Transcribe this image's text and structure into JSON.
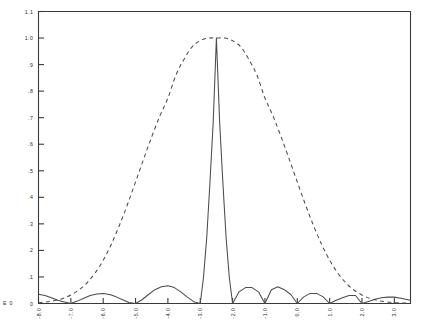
{
  "chart_data": {
    "type": "line",
    "title": "",
    "subtitle": "",
    "xlabel": "",
    "ylabel": "",
    "xlim": [
      -8.0,
      3.5
    ],
    "ylim": [
      0.0,
      1.1
    ],
    "grid": false,
    "legend": "none",
    "exponent_annotation": "E 0",
    "x_ticks": [
      "-8.0",
      "-7.0",
      "-6.0",
      "-5.0",
      "-4.0",
      "-3.0",
      "-2.0",
      "-1.0",
      "0.0",
      "1.0",
      "2.0",
      "3.0"
    ],
    "x_tick_values": [
      -8.0,
      -7.0,
      -6.0,
      -5.0,
      -4.0,
      -3.0,
      -2.0,
      -1.0,
      0.0,
      1.0,
      2.0,
      3.0
    ],
    "y_ticks": [
      "0",
      ".1",
      ".2",
      ".3",
      ".4",
      ".5",
      ".6",
      ".7",
      ".8",
      ".9",
      "1.0",
      "1.1"
    ],
    "y_tick_values": [
      0.0,
      0.1,
      0.2,
      0.3,
      0.4,
      0.5,
      0.6,
      0.7,
      0.8,
      0.9,
      1.0,
      1.1
    ],
    "series": [
      {
        "name": "rectified sinc",
        "style": "solid",
        "color": "#4a4a52",
        "peak_x": -2.5,
        "peak_y": 1.0,
        "zeros": [
          -5.0,
          -4.0,
          -3.0,
          -2.0,
          -1.0,
          0.0,
          1.0,
          2.0
        ],
        "x": [
          -8.0,
          -7.8,
          -7.6,
          -7.4,
          -7.2,
          -7.0,
          -6.8,
          -6.6,
          -6.4,
          -6.2,
          -6.0,
          -5.8,
          -5.6,
          -5.4,
          -5.2,
          -5.0,
          -4.8,
          -4.6,
          -4.4,
          -4.2,
          -4.0,
          -3.8,
          -3.6,
          -3.4,
          -3.2,
          -3.0,
          -2.9,
          -2.8,
          -2.7,
          -2.6,
          -2.5,
          -2.4,
          -2.3,
          -2.2,
          -2.1,
          -2.0,
          -1.8,
          -1.6,
          -1.4,
          -1.2,
          -1.0,
          -0.8,
          -0.6,
          -0.4,
          -0.2,
          0.0,
          0.2,
          0.4,
          0.6,
          0.8,
          1.0,
          1.2,
          1.4,
          1.6,
          1.8,
          2.0,
          2.2,
          2.4,
          2.6,
          2.8,
          3.0,
          3.2,
          3.5
        ],
        "y": [
          0.035,
          0.03,
          0.022,
          0.012,
          0.006,
          0.0,
          0.009,
          0.02,
          0.03,
          0.036,
          0.038,
          0.034,
          0.025,
          0.014,
          0.004,
          0.0,
          0.014,
          0.034,
          0.052,
          0.063,
          0.067,
          0.06,
          0.044,
          0.024,
          0.007,
          0.0,
          0.097,
          0.247,
          0.455,
          0.682,
          1.0,
          0.682,
          0.455,
          0.247,
          0.097,
          0.0,
          0.044,
          0.06,
          0.06,
          0.044,
          0.0,
          0.052,
          0.063,
          0.052,
          0.034,
          0.0,
          0.025,
          0.038,
          0.038,
          0.025,
          0.0,
          0.012,
          0.022,
          0.03,
          0.03,
          0.0,
          0.008,
          0.016,
          0.022,
          0.024,
          0.024,
          0.02,
          0.012
        ]
      },
      {
        "name": "gaussian envelope",
        "style": "dashed",
        "color": "#4a4a52",
        "peak_x": -2.5,
        "peak_y": 1.0,
        "x": [
          -8.0,
          -7.75,
          -7.5,
          -7.25,
          -7.0,
          -6.75,
          -6.5,
          -6.25,
          -6.0,
          -5.75,
          -5.5,
          -5.25,
          -5.0,
          -4.75,
          -4.5,
          -4.25,
          -4.0,
          -3.75,
          -3.5,
          -3.25,
          -3.0,
          -2.75,
          -2.5,
          -2.25,
          -2.0,
          -1.75,
          -1.5,
          -1.25,
          -1.0,
          -0.75,
          -0.5,
          -0.25,
          0.0,
          0.25,
          0.5,
          0.75,
          1.0,
          1.25,
          1.5,
          1.75,
          2.0,
          2.25,
          2.5,
          2.75,
          3.0,
          3.25,
          3.5
        ],
        "y": [
          0.003,
          0.006,
          0.011,
          0.019,
          0.032,
          0.051,
          0.078,
          0.115,
          0.163,
          0.223,
          0.294,
          0.373,
          0.458,
          0.544,
          0.628,
          0.706,
          0.774,
          0.861,
          0.92,
          0.967,
          0.99,
          1.0,
          1.0,
          1.0,
          0.99,
          0.967,
          0.92,
          0.861,
          0.774,
          0.706,
          0.628,
          0.544,
          0.458,
          0.373,
          0.294,
          0.223,
          0.163,
          0.115,
          0.078,
          0.051,
          0.032,
          0.019,
          0.011,
          0.006,
          0.003,
          0.002,
          0.001
        ]
      }
    ]
  }
}
